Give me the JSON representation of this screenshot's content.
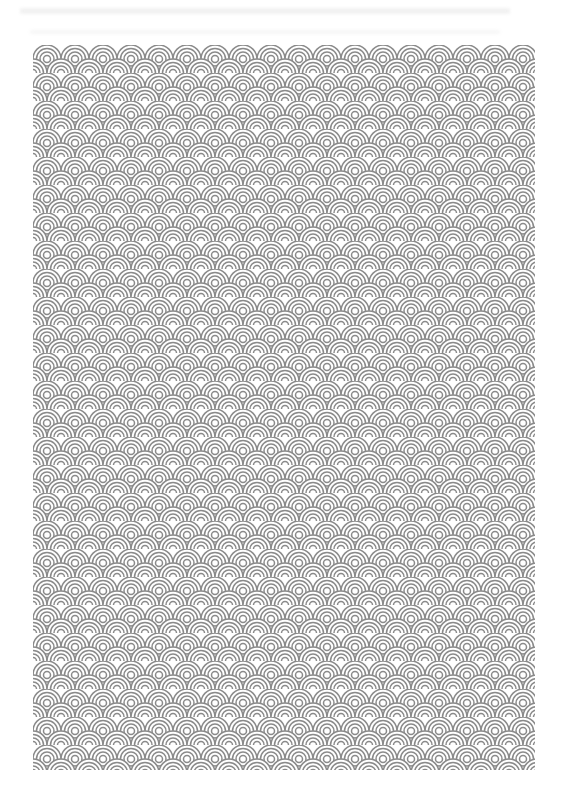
{
  "page": {
    "type": "scanned-page",
    "background_color": "#ffffff"
  },
  "header_bleed": {
    "legible": false,
    "color": "#ececec"
  },
  "pattern": {
    "name": "seigaiha-wave-pattern",
    "stroke_color": "#8a8a8a",
    "background_color": "#ffffff",
    "tile_width": 28,
    "tile_height": 14,
    "arcs_per_scale": 4,
    "columns": 18,
    "rows": 52
  }
}
